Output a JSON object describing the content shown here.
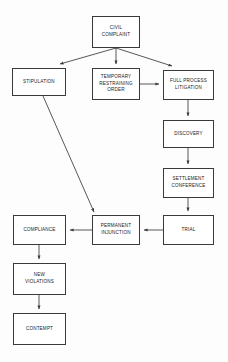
{
  "diagram": {
    "background_color": "#fdfdfd",
    "line_color": "#3a3a3a",
    "text_color": "#1a1a1a",
    "nodes": [
      {
        "id": "civil_complaint",
        "label": "CIVIL\nCOMPLAINT",
        "x": 92,
        "y": 16,
        "w": 48,
        "h": 32
      },
      {
        "id": "stipulation",
        "label": "STIPULATION",
        "x": 12,
        "y": 68,
        "w": 54,
        "h": 28
      },
      {
        "id": "temporary_restraining_order",
        "label": "TEMPORARY\nRESTRAINING\nORDER",
        "x": 92,
        "y": 68,
        "w": 48,
        "h": 32
      },
      {
        "id": "full_process_litigation",
        "label": "FULL PROCESS\nLITIGATION",
        "x": 163,
        "y": 70,
        "w": 51,
        "h": 30
      },
      {
        "id": "discovery",
        "label": "DISCOVERY",
        "x": 163,
        "y": 120,
        "w": 51,
        "h": 28
      },
      {
        "id": "settlement_conference",
        "label": "SETTLEMENT\nCONFERENCE",
        "x": 163,
        "y": 168,
        "w": 51,
        "h": 30
      },
      {
        "id": "trial",
        "label": "TRIAL",
        "x": 163,
        "y": 215,
        "w": 51,
        "h": 30
      },
      {
        "id": "permanent_injunction",
        "label": "PERMANENT\nINJUNCTION",
        "x": 92,
        "y": 215,
        "w": 48,
        "h": 30
      },
      {
        "id": "compliance",
        "label": "COMPLIANCE",
        "x": 13,
        "y": 215,
        "w": 53,
        "h": 30
      },
      {
        "id": "new_violations",
        "label": "NEW\nVIOLATIONS",
        "x": 13,
        "y": 263,
        "w": 53,
        "h": 32
      },
      {
        "id": "contempt",
        "label": "CONTEMPT",
        "x": 13,
        "y": 313,
        "w": 53,
        "h": 32
      }
    ],
    "edges": [
      {
        "id": "edge-complaint-stipulation",
        "from": "civil_complaint",
        "to": "stipulation",
        "points": "116,48 60,64"
      },
      {
        "id": "edge-complaint-tro",
        "from": "civil_complaint",
        "to": "temporary_restraining_order",
        "points": "116,48 116,64"
      },
      {
        "id": "edge-complaint-litigation",
        "from": "civil_complaint",
        "to": "full_process_litigation",
        "points": "116,48 172,66"
      },
      {
        "id": "edge-tro-litigation",
        "from": "temporary_restraining_order",
        "to": "full_process_litigation",
        "points": "140,84 159,84"
      },
      {
        "id": "edge-litigation-discovery",
        "from": "full_process_litigation",
        "to": "discovery",
        "points": "188,100 188,116"
      },
      {
        "id": "edge-discovery-settlement",
        "from": "discovery",
        "to": "settlement_conference",
        "points": "188,148 188,164"
      },
      {
        "id": "edge-settlement-trial",
        "from": "settlement_conference",
        "to": "trial",
        "points": "188,198 188,211"
      },
      {
        "id": "edge-trial-injunction",
        "from": "trial",
        "to": "permanent_injunction",
        "points": "163,230 144,230"
      },
      {
        "id": "edge-injunction-compliance",
        "from": "permanent_injunction",
        "to": "compliance",
        "points": "92,230 70,230"
      },
      {
        "id": "edge-stipulation-injunction",
        "from": "stipulation",
        "to": "permanent_injunction",
        "points": "43,96 94,212"
      },
      {
        "id": "edge-compliance-violations",
        "from": "compliance",
        "to": "new_violations",
        "points": "39,245 39,259"
      },
      {
        "id": "edge-violations-contempt",
        "from": "new_violations",
        "to": "contempt",
        "points": "39,295 39,309"
      }
    ]
  }
}
